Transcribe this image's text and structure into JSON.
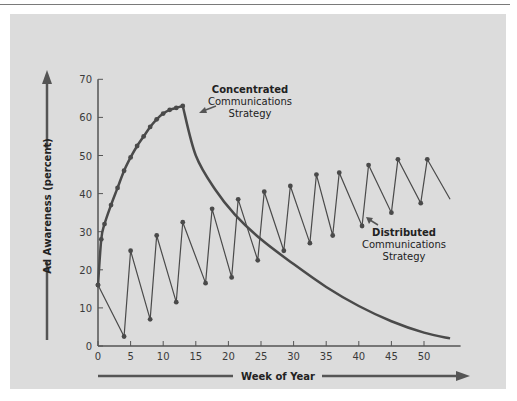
{
  "chart_data": {
    "type": "line",
    "title": "",
    "xlabel": "Week of Year",
    "ylabel": "Ad Awareness (percent)",
    "xlim": [
      0,
      55
    ],
    "ylim": [
      0,
      70
    ],
    "x_ticks": [
      0,
      5,
      10,
      15,
      20,
      25,
      30,
      35,
      40,
      45,
      50
    ],
    "y_ticks": [
      0,
      10,
      20,
      30,
      40,
      50,
      60,
      70
    ],
    "grid": false,
    "legend": "none (inline annotations)",
    "series": [
      {
        "name": "Concentrated Communications Strategy",
        "style": "thick line, markers during first 13 weeks",
        "x": [
          0,
          0.5,
          1,
          2,
          3,
          4,
          5,
          6,
          7,
          8,
          9,
          10,
          11,
          12,
          13,
          15,
          18,
          21,
          25,
          30,
          35,
          40,
          45,
          50,
          54
        ],
        "values": [
          16,
          28,
          32,
          37,
          41.5,
          46,
          49.5,
          52.5,
          55,
          57.5,
          59.5,
          61,
          62,
          62.5,
          63,
          50,
          41,
          34.5,
          28,
          21.5,
          15.5,
          10.5,
          6.5,
          3.5,
          2
        ]
      },
      {
        "name": "Distributed Communications Strategy",
        "style": "thin sawtooth line with markers",
        "x": [
          0,
          4,
          5,
          8,
          9,
          12,
          13,
          16.5,
          17.5,
          20.5,
          21.5,
          24.5,
          25.5,
          28.5,
          29.5,
          32.5,
          33.5,
          36,
          37,
          40.5,
          41.5,
          45,
          46,
          49.5,
          50.5,
          54
        ],
        "values": [
          16,
          2.5,
          25,
          7,
          29,
          11.5,
          32.5,
          16.5,
          36,
          18,
          38.5,
          22.5,
          40.5,
          25,
          42,
          27,
          45,
          29,
          45.5,
          31.5,
          47.5,
          35,
          49,
          37.5,
          49,
          38.5
        ]
      }
    ],
    "annotations": [
      {
        "bold": "Concentrated",
        "lines": [
          "Communications",
          "Strategy"
        ]
      },
      {
        "bold": "Distributed",
        "lines": [
          "Communications",
          "Strategy"
        ]
      }
    ]
  },
  "labels": {
    "xlabel": "Week of Year",
    "ylabel": "Ad Awareness (percent)",
    "conc_bold": "Concentrated",
    "conc_l1": "Communications",
    "conc_l2": "Strategy",
    "dist_bold": "Distributed",
    "dist_l1": "Communications",
    "dist_l2": "Strategy"
  },
  "colors": {
    "panel": "#dcdcdc",
    "line": "#4a4a4a",
    "axis": "#555555",
    "arrow": "#555555"
  }
}
